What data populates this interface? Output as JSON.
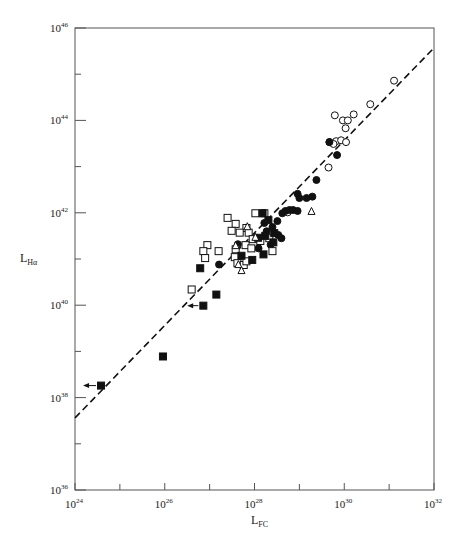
{
  "chart_data": {
    "type": "scatter",
    "title": "",
    "xlabel": "L_FC",
    "ylabel": "L_Hα",
    "xlabel_main": "L",
    "xlabel_sub": "FC",
    "ylabel_main": "L",
    "ylabel_sub": "Hα",
    "xscale": "log",
    "yscale": "log",
    "xlim_log10": [
      24,
      32
    ],
    "ylim_log10": [
      36,
      46
    ],
    "x_ticks": [
      {
        "base": "10",
        "exp": "24",
        "value": 24
      },
      {
        "base": "10",
        "exp": "26",
        "value": 26
      },
      {
        "base": "10",
        "exp": "28",
        "value": 28
      },
      {
        "base": "10",
        "exp": "30",
        "value": 30
      },
      {
        "base": "10",
        "exp": "32",
        "value": 32
      }
    ],
    "y_ticks": [
      {
        "base": "10",
        "exp": "36",
        "value": 36
      },
      {
        "base": "10",
        "exp": "38",
        "value": 38
      },
      {
        "base": "10",
        "exp": "40",
        "value": 40
      },
      {
        "base": "10",
        "exp": "42",
        "value": 42
      },
      {
        "base": "10",
        "exp": "44",
        "value": 44
      },
      {
        "base": "10",
        "exp": "46",
        "value": 46
      }
    ],
    "grid": false,
    "legend": null,
    "fit_line": {
      "style": "dashed",
      "log_x": [
        24,
        32
      ],
      "log_y": [
        37.56,
        45.57
      ]
    },
    "series": [
      {
        "name": "open-circles",
        "marker": "circle",
        "filled": false,
        "points_log10": [
          [
            31.11,
            44.86
          ],
          [
            30.58,
            44.35
          ],
          [
            29.79,
            44.11
          ],
          [
            29.97,
            44.0
          ],
          [
            30.08,
            44.0
          ],
          [
            30.21,
            44.13
          ],
          [
            30.03,
            43.83
          ],
          [
            29.67,
            43.53
          ],
          [
            29.82,
            43.55
          ],
          [
            29.93,
            43.57
          ],
          [
            30.04,
            43.53
          ],
          [
            29.76,
            43.49
          ],
          [
            29.65,
            42.98
          ],
          [
            28.74,
            42.01
          ]
        ]
      },
      {
        "name": "filled-circles",
        "marker": "circle",
        "filled": true,
        "points_log10": [
          [
            29.67,
            43.53
          ],
          [
            29.84,
            43.25
          ],
          [
            29.38,
            42.71
          ],
          [
            28.96,
            42.41
          ],
          [
            29.0,
            42.32
          ],
          [
            29.16,
            42.32
          ],
          [
            29.29,
            42.35
          ],
          [
            28.69,
            42.04
          ],
          [
            28.78,
            42.06
          ],
          [
            28.86,
            42.06
          ],
          [
            28.96,
            42.04
          ],
          [
            28.62,
            41.99
          ],
          [
            28.4,
            41.69
          ],
          [
            28.53,
            41.52
          ],
          [
            28.36,
            41.31
          ],
          [
            28.6,
            41.45
          ],
          [
            28.22,
            41.78
          ],
          [
            27.63,
            41.32
          ],
          [
            27.21,
            40.88
          ],
          [
            28.09,
            41.23
          ],
          [
            28.51,
            41.82
          ],
          [
            28.27,
            41.6
          ]
        ]
      },
      {
        "name": "open-squares",
        "marker": "square",
        "filled": false,
        "points_log10": [
          [
            27.4,
            41.89
          ],
          [
            27.58,
            41.76
          ],
          [
            27.82,
            41.67
          ],
          [
            27.49,
            41.61
          ],
          [
            27.67,
            41.57
          ],
          [
            27.87,
            41.57
          ],
          [
            27.96,
            41.43
          ],
          [
            26.95,
            41.3
          ],
          [
            27.2,
            41.17
          ],
          [
            27.58,
            41.21
          ],
          [
            27.8,
            41.3
          ],
          [
            26.86,
            41.17
          ],
          [
            26.9,
            41.02
          ],
          [
            27.56,
            41.04
          ],
          [
            27.62,
            40.91
          ],
          [
            27.76,
            40.87
          ],
          [
            27.82,
            40.95
          ],
          [
            26.6,
            40.34
          ],
          [
            28.22,
            41.99
          ],
          [
            28.02,
            41.99
          ],
          [
            28.13,
            41.39
          ],
          [
            27.93,
            41.23
          ],
          [
            28.33,
            41.45
          ],
          [
            28.4,
            41.17
          ]
        ]
      },
      {
        "name": "filled-squares",
        "marker": "square",
        "filled": true,
        "points_log10": [
          [
            28.18,
            41.99
          ],
          [
            28.31,
            41.84
          ],
          [
            28.24,
            41.5
          ],
          [
            28.44,
            41.56
          ],
          [
            28.08,
            41.46
          ],
          [
            26.79,
            40.8
          ],
          [
            27.71,
            41.07
          ],
          [
            27.95,
            40.98
          ],
          [
            27.15,
            40.23
          ],
          [
            26.86,
            39.99
          ],
          [
            25.96,
            38.89
          ],
          [
            24.58,
            38.26
          ],
          [
            28.42,
            41.36
          ],
          [
            28.2,
            41.1
          ]
        ]
      },
      {
        "name": "open-triangles",
        "marker": "triangle",
        "filled": false,
        "points_log10": [
          [
            27.84,
            41.71
          ],
          [
            29.27,
            42.04
          ],
          [
            27.64,
            40.89
          ],
          [
            27.71,
            40.76
          ],
          [
            27.58,
            41.3
          ],
          [
            28.02,
            41.48
          ]
        ]
      }
    ],
    "upper_limits_arrows": [
      {
        "from_log": [
          26.86,
          39.99
        ],
        "to_log": [
          26.5,
          39.99
        ],
        "direction": "left"
      },
      {
        "from_log": [
          24.58,
          38.26
        ],
        "to_log": [
          24.18,
          38.26
        ],
        "direction": "left"
      }
    ]
  }
}
